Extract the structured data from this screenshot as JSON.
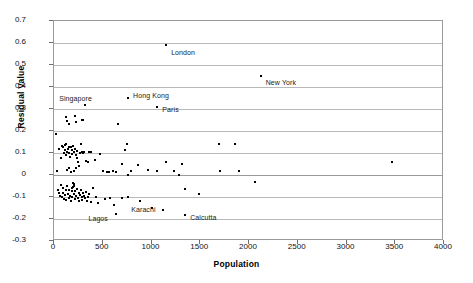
{
  "chart_data": {
    "type": "scatter",
    "title": "",
    "xlabel": "Population",
    "ylabel": "Residual Value",
    "xlim": [
      0,
      4000
    ],
    "ylim": [
      -0.3,
      0.7
    ],
    "xticks": [
      0,
      500,
      1000,
      1500,
      2000,
      2500,
      3000,
      3500,
      4000
    ],
    "xtick_labels": [
      "0",
      "500",
      "1000",
      "1500",
      "2000",
      "2500",
      "3000",
      "3500",
      "4000"
    ],
    "yticks": [
      -0.3,
      -0.2,
      -0.1,
      0,
      0.1,
      0.2,
      0.3,
      0.4,
      0.5,
      0.6,
      0.7
    ],
    "ytick_labels": [
      "-0.3",
      "-0.2",
      "-0.1",
      "0",
      "0.1",
      "0.2",
      "0.3",
      "0.4",
      "0.5",
      "0.6",
      "0.7"
    ],
    "grid": "horizontal",
    "legend": null,
    "marker_color": "#000000",
    "series": [
      {
        "name": "cities",
        "points": [
          [
            1150,
            0.592
          ],
          [
            2120,
            0.452
          ],
          [
            760,
            0.35
          ],
          [
            320,
            0.318
          ],
          [
            1060,
            0.308
          ],
          [
            20,
            0.188
          ],
          [
            120,
            0.262
          ],
          [
            135,
            0.246
          ],
          [
            150,
            0.234
          ],
          [
            215,
            0.268
          ],
          [
            230,
            0.24
          ],
          [
            285,
            0.248
          ],
          [
            300,
            0.248
          ],
          [
            660,
            0.23
          ],
          [
            55,
            0.118
          ],
          [
            70,
            0.078
          ],
          [
            78,
            0.132
          ],
          [
            95,
            0.128
          ],
          [
            100,
            0.098
          ],
          [
            108,
            0.138
          ],
          [
            115,
            0.112
          ],
          [
            120,
            0.142
          ],
          [
            128,
            0.09
          ],
          [
            135,
            0.106
          ],
          [
            142,
            0.118
          ],
          [
            150,
            0.128
          ],
          [
            158,
            0.1
          ],
          [
            165,
            0.084
          ],
          [
            172,
            0.126
          ],
          [
            180,
            0.112
          ],
          [
            188,
            0.096
          ],
          [
            196,
            0.134
          ],
          [
            205,
            0.104
          ],
          [
            212,
            0.12
          ],
          [
            222,
            0.09
          ],
          [
            232,
            0.11
          ],
          [
            240,
            0.078
          ],
          [
            250,
            0.06
          ],
          [
            262,
            0.1
          ],
          [
            272,
            0.14
          ],
          [
            285,
            0.104
          ],
          [
            298,
            0.102
          ],
          [
            312,
            0.104
          ],
          [
            330,
            0.062
          ],
          [
            345,
            0.058
          ],
          [
            360,
            0.104
          ],
          [
            375,
            0.104
          ],
          [
            420,
            0.068
          ],
          [
            470,
            0.094
          ],
          [
            500,
            0.016
          ],
          [
            540,
            0.012
          ],
          [
            560,
            0.012
          ],
          [
            600,
            0.018
          ],
          [
            640,
            0.012
          ],
          [
            700,
            0.052
          ],
          [
            730,
            0.112
          ],
          [
            745,
            0.14
          ],
          [
            760,
            0.0
          ],
          [
            790,
            0.02
          ],
          [
            860,
            0.044
          ],
          [
            960,
            0.022
          ],
          [
            1060,
            0.018
          ],
          [
            1150,
            0.06
          ],
          [
            1230,
            0.02
          ],
          [
            1280,
            0.0
          ],
          [
            1310,
            0.05
          ],
          [
            1340,
            -0.062
          ],
          [
            1490,
            -0.088
          ],
          [
            1690,
            0.14
          ],
          [
            1700,
            0.016
          ],
          [
            1860,
            0.14
          ],
          [
            1900,
            0.02
          ],
          [
            2060,
            -0.03
          ],
          [
            3470,
            0.058
          ],
          [
            30,
            0.018
          ],
          [
            40,
            -0.068
          ],
          [
            50,
            -0.082
          ],
          [
            60,
            -0.094
          ],
          [
            70,
            -0.046
          ],
          [
            80,
            -0.1
          ],
          [
            88,
            -0.058
          ],
          [
            96,
            -0.084
          ],
          [
            104,
            -0.108
          ],
          [
            112,
            -0.092
          ],
          [
            120,
            -0.07
          ],
          [
            128,
            -0.112
          ],
          [
            136,
            -0.048
          ],
          [
            142,
            -0.086
          ],
          [
            150,
            -0.104
          ],
          [
            158,
            -0.066
          ],
          [
            166,
            -0.096
          ],
          [
            172,
            -0.116
          ],
          [
            180,
            -0.074
          ],
          [
            188,
            -0.1
          ],
          [
            196,
            -0.056
          ],
          [
            204,
            -0.088
          ],
          [
            212,
            -0.11
          ],
          [
            220,
            -0.072
          ],
          [
            228,
            -0.094
          ],
          [
            236,
            -0.062
          ],
          [
            244,
            -0.104
          ],
          [
            252,
            -0.08
          ],
          [
            260,
            -0.118
          ],
          [
            268,
            -0.09
          ],
          [
            276,
            -0.07
          ],
          [
            284,
            -0.1
          ],
          [
            292,
            -0.112
          ],
          [
            300,
            -0.084
          ],
          [
            310,
            -0.096
          ],
          [
            320,
            -0.106
          ],
          [
            330,
            -0.076
          ],
          [
            340,
            -0.118
          ],
          [
            352,
            -0.098
          ],
          [
            364,
            -0.088
          ],
          [
            378,
            -0.122
          ],
          [
            400,
            -0.06
          ],
          [
            430,
            -0.1
          ],
          [
            455,
            -0.126
          ],
          [
            520,
            -0.108
          ],
          [
            570,
            -0.104
          ],
          [
            620,
            -0.138
          ],
          [
            700,
            -0.104
          ],
          [
            760,
            -0.1
          ],
          [
            880,
            -0.118
          ],
          [
            1000,
            -0.148
          ],
          [
            1120,
            -0.158
          ],
          [
            1345,
            -0.184
          ],
          [
            640,
            -0.176
          ],
          [
            180,
            -0.06
          ],
          [
            200,
            -0.052
          ],
          [
            190,
            -0.038
          ],
          [
            210,
            -0.04
          ],
          [
            150,
            0.03
          ],
          [
            170,
            0.012
          ],
          [
            130,
            0.022
          ],
          [
            260,
            0.04
          ],
          [
            230,
            0.032
          ],
          [
            205,
            0.016
          ]
        ]
      }
    ],
    "annotations": [
      {
        "label": "London",
        "x": 1150,
        "y": 0.592,
        "dx": 5,
        "dy": 4
      },
      {
        "label": "New York",
        "x": 2120,
        "y": 0.452,
        "dx": 5,
        "dy": 3
      },
      {
        "label": "Hong Kong",
        "x": 760,
        "y": 0.35,
        "dx": 5,
        "dy": -6
      },
      {
        "label": "Singapore",
        "x": 320,
        "y": 0.318,
        "dx": -26,
        "dy": -10
      },
      {
        "label": "Paris",
        "x": 1060,
        "y": 0.308,
        "dx": 5,
        "dy": -1
      },
      {
        "label": "Karachi",
        "x": 1120,
        "y": -0.158,
        "dx": -32,
        "dy": -4
      },
      {
        "label": "Lagos",
        "x": 640,
        "y": -0.176,
        "dx": -28,
        "dy": 1
      },
      {
        "label": "Calcutta",
        "x": 1345,
        "y": -0.184,
        "dx": 5,
        "dy": -1
      }
    ]
  }
}
